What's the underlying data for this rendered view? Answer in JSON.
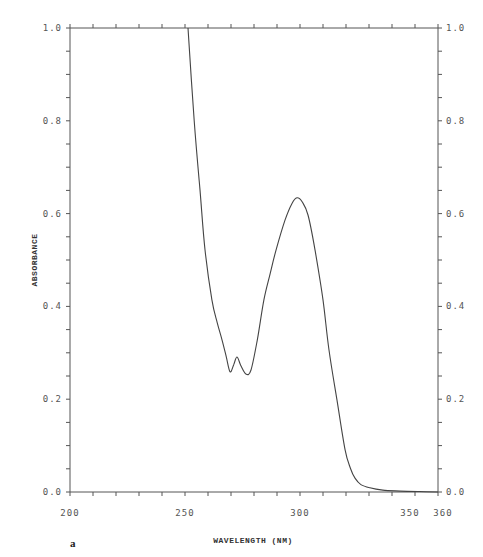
{
  "chart_data": {
    "type": "line",
    "title": "",
    "panel_label": "a",
    "xlabel": "WAVELENGTH (NM)",
    "ylabel": "ABSORBANCE",
    "xlim": [
      200,
      360
    ],
    "ylim": [
      0.0,
      1.0
    ],
    "x_tick_labels": [
      {
        "value": 200,
        "label": "200"
      },
      {
        "value": 250,
        "label": "250"
      },
      {
        "value": 300,
        "label": "300"
      },
      {
        "value": 350,
        "label": "350"
      },
      {
        "value": 360,
        "label": "360"
      }
    ],
    "x_minor_tick_step": 10,
    "y_tick_labels_left": [
      {
        "value": 1.0,
        "label": "1.0"
      },
      {
        "value": 0.8,
        "label": "0.8"
      },
      {
        "value": 0.6,
        "label": "0.6"
      },
      {
        "value": 0.4,
        "label": "0.4"
      },
      {
        "value": 0.2,
        "label": "0.2"
      },
      {
        "value": 0.0,
        "label": "0.0"
      }
    ],
    "y_tick_labels_right": [
      {
        "value": 1.0,
        "label": "1.0"
      },
      {
        "value": 0.8,
        "label": "0.8"
      },
      {
        "value": 0.6,
        "label": "0.6"
      },
      {
        "value": 0.4,
        "label": "0.4"
      },
      {
        "value": 0.2,
        "label": "0.2"
      },
      {
        "value": 0.0,
        "label": "0.0"
      }
    ],
    "y_minor_tick_step": 0.05,
    "grid": false,
    "series": [
      {
        "name": "absorbance spectrum",
        "color": "#444444",
        "x": [
          251.3,
          254.0,
          256.5,
          258.7,
          261.7,
          264.0,
          266.1,
          268.0,
          269.6,
          271.2,
          272.6,
          274.3,
          276.5,
          278.7,
          281.5,
          284.3,
          287.0,
          289.6,
          293.5,
          296.5,
          298.7,
          301.0,
          303.5,
          306.5,
          310.0,
          312.6,
          316.1,
          319.6,
          322.0,
          323.9,
          326.5,
          330.4,
          336.0,
          343.5,
          352.0,
          360.0
        ],
        "y": [
          1.0,
          0.8,
          0.651,
          0.522,
          0.414,
          0.365,
          0.328,
          0.29,
          0.259,
          0.275,
          0.291,
          0.272,
          0.254,
          0.263,
          0.33,
          0.414,
          0.47,
          0.522,
          0.586,
          0.622,
          0.634,
          0.625,
          0.597,
          0.522,
          0.414,
          0.306,
          0.198,
          0.091,
          0.05,
          0.03,
          0.016,
          0.009,
          0.004,
          0.002,
          0.001,
          0.0
        ]
      }
    ]
  }
}
